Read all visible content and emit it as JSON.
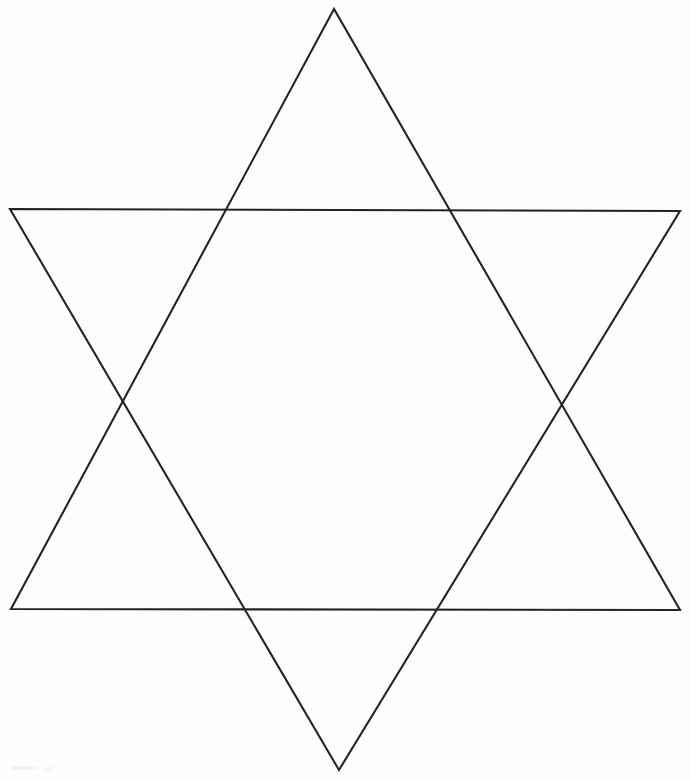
{
  "page": {
    "kind": "geometric-line-drawing",
    "width": 691,
    "height": 780,
    "background_color": "#fefefe",
    "has_text": false,
    "text_content": ""
  },
  "figure": {
    "name": "hexagram",
    "alt_names": [
      "Star of David",
      "Magen David",
      "six-pointed star"
    ],
    "stroke_color": "#242424",
    "stroke_width": 2.1,
    "fill": "none",
    "shapes": [
      {
        "name": "upward-triangle",
        "orientation": "point-up",
        "points": "334,9 11,609 680,610",
        "vertices": [
          {
            "label": "top-apex",
            "x": 334,
            "y": 9
          },
          {
            "label": "bottom-left",
            "x": 11,
            "y": 609
          },
          {
            "label": "bottom-right",
            "x": 680,
            "y": 610
          }
        ]
      },
      {
        "name": "downward-triangle",
        "orientation": "point-down",
        "points": "10,209 680,211 339,770",
        "vertices": [
          {
            "label": "top-left",
            "x": 10,
            "y": 209
          },
          {
            "label": "top-right",
            "x": 680,
            "y": 211
          },
          {
            "label": "bottom-apex",
            "x": 339,
            "y": 770
          }
        ]
      }
    ],
    "intersections": [
      {
        "label": "upper-left-crossing",
        "x": 224,
        "y": 213
      },
      {
        "label": "upper-right-crossing",
        "x": 448,
        "y": 212
      },
      {
        "label": "left-crossing",
        "x": 123,
        "y": 402
      },
      {
        "label": "right-crossing",
        "x": 561,
        "y": 403
      },
      {
        "label": "lower-left-crossing",
        "x": 243,
        "y": 609
      },
      {
        "label": "lower-right-crossing",
        "x": 433,
        "y": 609
      }
    ],
    "inner_hexagon": {
      "name": "central-hexagon",
      "points": "224,213 448,212 561,403 433,609 243,609 123,402"
    },
    "star_points_count": 6
  }
}
